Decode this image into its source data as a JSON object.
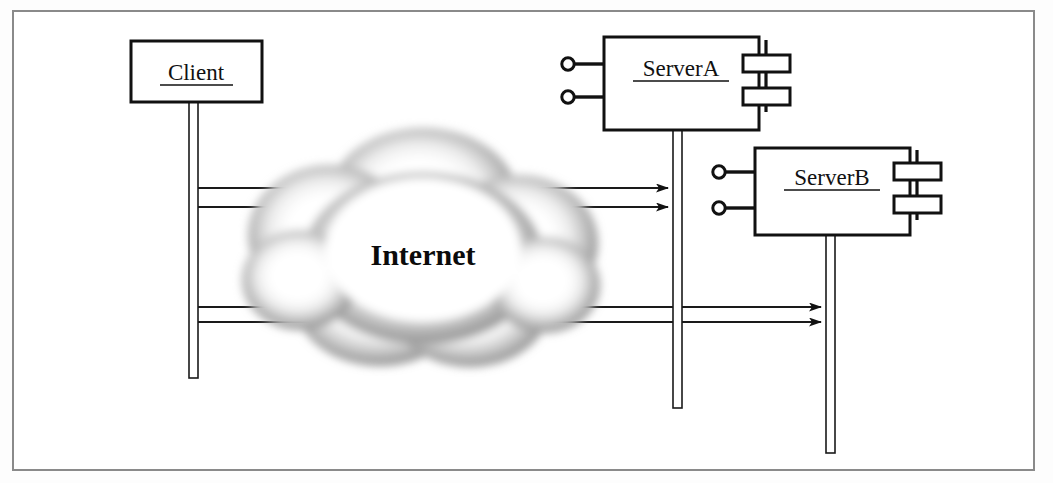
{
  "diagram": {
    "frame": {
      "stroke": "#8a8a8a",
      "fill": "#ffffff"
    },
    "colors": {
      "line": "#1a1a1a",
      "cloud_edge": "#8d8d8d",
      "cloud_mid": "#b5b5b5",
      "cloud_core": "#ffffff",
      "text": "#111111"
    },
    "nodes": [
      {
        "id": "client",
        "type": "box",
        "label": "Client",
        "underlined": true,
        "x": 131,
        "y": 41,
        "w": 131,
        "h": 61,
        "lifeline": {
          "x": 189,
          "y": 102,
          "w": 9,
          "h": 276
        }
      },
      {
        "id": "serverA",
        "type": "component",
        "label": "ServerA",
        "underlined": true,
        "x": 604,
        "y": 37,
        "w": 155,
        "h": 93,
        "lifeline": {
          "x": 673,
          "y": 130,
          "w": 9,
          "h": 278
        },
        "lollipops": [
          {
            "cx": 568,
            "cy": 64,
            "r": 6,
            "stem_to": 604
          },
          {
            "cx": 568,
            "cy": 97,
            "r": 6,
            "stem_to": 604
          }
        ],
        "sockets": [
          {
            "x": 743,
            "y": 55,
            "w": 47,
            "h": 17
          },
          {
            "x": 743,
            "y": 88,
            "w": 47,
            "h": 17
          }
        ]
      },
      {
        "id": "serverB",
        "type": "component",
        "label": "ServerB",
        "underlined": true,
        "x": 755,
        "y": 148,
        "w": 155,
        "h": 87,
        "lifeline": {
          "x": 826,
          "y": 235,
          "w": 9,
          "h": 218
        },
        "lollipops": [
          {
            "cx": 719,
            "cy": 172,
            "r": 6,
            "stem_to": 755
          },
          {
            "cx": 719,
            "cy": 208,
            "r": 6,
            "stem_to": 755
          }
        ],
        "sockets": [
          {
            "x": 894,
            "y": 163,
            "w": 47,
            "h": 17
          },
          {
            "x": 894,
            "y": 196,
            "w": 47,
            "h": 17
          }
        ]
      }
    ],
    "cloud": {
      "label": "Internet",
      "cx": 423,
      "cy": 255,
      "rx": 142,
      "ry": 120,
      "label_x": 423,
      "label_y": 265
    },
    "messages": [
      {
        "id": "msg1",
        "from": "client",
        "to": "serverA",
        "x1": 198,
        "y1": 188,
        "x2": 668,
        "y2": 188
      },
      {
        "id": "msg2",
        "from": "client",
        "to": "serverA",
        "x1": 198,
        "y1": 207,
        "x2": 668,
        "y2": 207
      },
      {
        "id": "msg3",
        "from": "client",
        "to": "serverB",
        "x1": 198,
        "y1": 307,
        "x2": 821,
        "y2": 307
      },
      {
        "id": "msg4",
        "from": "client",
        "to": "serverB",
        "x1": 198,
        "y1": 322,
        "x2": 821,
        "y2": 322
      }
    ]
  }
}
